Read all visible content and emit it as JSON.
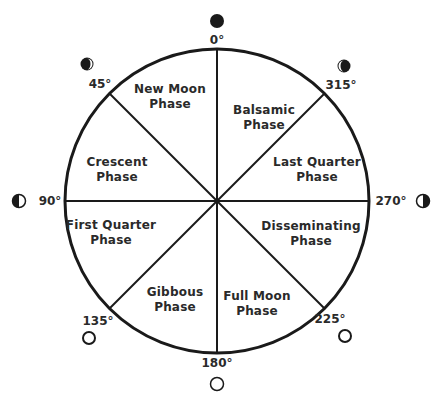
{
  "diagram": {
    "type": "lunar phase wheel",
    "center": {
      "x": 217,
      "y": 201
    },
    "radius": 152,
    "colors": {
      "ink": "#1a1a1a",
      "background": "#ffffff"
    },
    "phases": [
      {
        "label_line1": "New Moon",
        "label_line2": "Phase",
        "x": 170,
        "y": 97
      },
      {
        "label_line1": "Balsamic",
        "label_line2": "Phase",
        "x": 264,
        "y": 118
      },
      {
        "label_line1": "Last Quarter",
        "label_line2": "Phase",
        "x": 317,
        "y": 170
      },
      {
        "label_line1": "Disseminating",
        "label_line2": "Phase",
        "x": 311,
        "y": 234
      },
      {
        "label_line1": "Full Moon",
        "label_line2": "Phase",
        "x": 257,
        "y": 304
      },
      {
        "label_line1": "Gibbous",
        "label_line2": "Phase",
        "x": 175,
        "y": 300
      },
      {
        "label_line1": "First Quarter",
        "label_line2": "Phase",
        "x": 111,
        "y": 233
      },
      {
        "label_line1": "Crescent",
        "label_line2": "Phase",
        "x": 117,
        "y": 170
      }
    ],
    "angles": [
      {
        "label": "0°",
        "x": 217,
        "y": 40,
        "moon": "new-moon-icon",
        "mx": 217,
        "my": 21
      },
      {
        "label": "315°",
        "x": 341,
        "y": 85,
        "moon": "waning-crescent-icon",
        "mx": 344,
        "my": 66
      },
      {
        "label": "270°",
        "x": 391,
        "y": 201,
        "moon": "last-quarter-icon",
        "mx": 423,
        "my": 201
      },
      {
        "label": "225°",
        "x": 330,
        "y": 319,
        "moon": "waning-gibbous-icon",
        "mx": 345,
        "my": 336
      },
      {
        "label": "180°",
        "x": 217,
        "y": 363,
        "moon": "full-moon-icon",
        "mx": 217,
        "my": 384
      },
      {
        "label": "135°",
        "x": 98,
        "y": 321,
        "moon": "waxing-gibbous-icon",
        "mx": 89,
        "my": 338
      },
      {
        "label": "90°",
        "x": 50,
        "y": 201,
        "moon": "first-quarter-icon",
        "mx": 19,
        "my": 201
      },
      {
        "label": "45°",
        "x": 100,
        "y": 84,
        "moon": "waxing-crescent-icon",
        "mx": 87,
        "my": 64
      }
    ]
  }
}
